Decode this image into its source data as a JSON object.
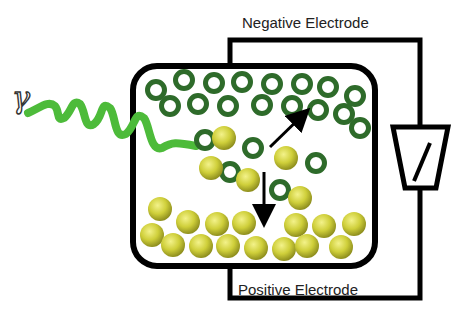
{
  "labels": {
    "negative_electrode": "Negative Electrode",
    "positive_electrode": "Positive Electrode",
    "gamma": "γ"
  },
  "colors": {
    "ring": "#2e6b2a",
    "ball": "#c9c932",
    "ball_highlight": "#f1f07a",
    "wave": "#4dbb3a",
    "line": "#000000"
  },
  "rings": [
    [
      156,
      90
    ],
    [
      184,
      80
    ],
    [
      214,
      83
    ],
    [
      242,
      82
    ],
    [
      272,
      84
    ],
    [
      302,
      84
    ],
    [
      328,
      87
    ],
    [
      355,
      96
    ],
    [
      170,
      106
    ],
    [
      198,
      104
    ],
    [
      228,
      106
    ],
    [
      262,
      105
    ],
    [
      292,
      106
    ],
    [
      318,
      110
    ],
    [
      344,
      114
    ],
    [
      360,
      128
    ],
    [
      205,
      140
    ],
    [
      253,
      148
    ],
    [
      316,
      163
    ],
    [
      230,
      172
    ],
    [
      280,
      190
    ]
  ],
  "balls": [
    [
      224,
      138
    ],
    [
      286,
      158
    ],
    [
      211,
      168
    ],
    [
      248,
      180
    ],
    [
      300,
      198
    ],
    [
      160,
      209
    ],
    [
      188,
      222
    ],
    [
      217,
      224
    ],
    [
      244,
      223
    ],
    [
      296,
      225
    ],
    [
      324,
      226
    ],
    [
      354,
      224
    ],
    [
      152,
      235
    ],
    [
      173,
      245
    ],
    [
      201,
      246
    ],
    [
      228,
      246
    ],
    [
      256,
      248
    ],
    [
      284,
      249
    ],
    [
      307,
      246
    ],
    [
      341,
      247
    ]
  ],
  "arrows": [
    {
      "name": "electron-arrow",
      "from": [
        270,
        147
      ],
      "to": [
        306,
        112
      ]
    },
    {
      "name": "hole-arrow",
      "from": [
        264,
        172
      ],
      "to": [
        264,
        222
      ]
    }
  ]
}
